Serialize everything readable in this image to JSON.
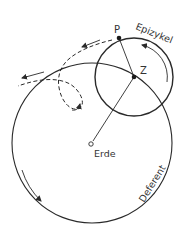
{
  "diagram": {
    "labels": {
      "point_p": "P",
      "center_z": "Z",
      "epicycle": "Epizykel",
      "earth": "Erde",
      "deferent": "Deferent"
    },
    "colors": {
      "stroke": "#2a2a2a",
      "text": "#333333",
      "background": "#ffffff"
    }
  }
}
